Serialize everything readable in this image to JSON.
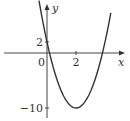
{
  "chart_data": {
    "type": "line",
    "title": "",
    "xlabel": "x",
    "ylabel": "y",
    "function": "y = 3(x - 2)^2 - 10",
    "xlim": [
      -3.2,
      5.6
    ],
    "ylim": [
      -11.5,
      9.5
    ],
    "origin_label": "0",
    "x_ticks": [
      {
        "value": 2,
        "label": "2"
      }
    ],
    "y_ticks": [
      {
        "value": 2,
        "label": "2"
      },
      {
        "value": -10,
        "label": "−10"
      }
    ],
    "series": [
      {
        "name": "parabola",
        "x": [
          -0.55,
          0,
          0.17,
          1,
          2,
          3,
          3.83,
          4.4
        ],
        "y": [
          9.5,
          2,
          0,
          -7,
          -10,
          -7,
          0,
          7.3
        ]
      }
    ],
    "vertex": {
      "x": 2,
      "y": -10
    },
    "grid": false,
    "legend": "none"
  }
}
